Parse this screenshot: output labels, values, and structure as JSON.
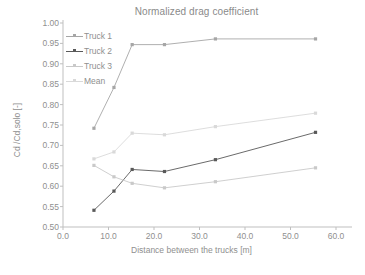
{
  "chart_data": {
    "type": "line",
    "title": "Normalized drag coefficient",
    "xlabel": "Distance between the trucks [m]",
    "ylabel": "Cd /Cd,solo [-]",
    "xlim": [
      0.0,
      60.0
    ],
    "ylim": [
      0.5,
      1.0
    ],
    "xticks": [
      "0.0",
      "10.0",
      "20.0",
      "30.0",
      "40.0",
      "50.0",
      "60.0"
    ],
    "xtick_values": [
      0.0,
      10.0,
      20.0,
      30.0,
      40.0,
      50.0,
      60.0
    ],
    "yticks": [
      "0.50",
      "0.55",
      "0.60",
      "0.65",
      "0.70",
      "0.75",
      "0.80",
      "0.85",
      "0.90",
      "0.95",
      "1.00"
    ],
    "ytick_values": [
      0.5,
      0.55,
      0.6,
      0.65,
      0.7,
      0.75,
      0.8,
      0.85,
      0.9,
      0.95,
      1.0
    ],
    "grid": false,
    "legend_position": "upper-left-inside",
    "x": [
      6.8,
      11.2,
      15.2,
      22.3,
      33.5,
      55.5
    ],
    "series": [
      {
        "name": "Truck 1",
        "color": "#a6a6a6",
        "marker": "square",
        "x": [
          6.8,
          11.2,
          15.2,
          22.3,
          33.5,
          55.5
        ],
        "values": [
          0.742,
          0.842,
          0.947,
          0.947,
          0.961,
          0.961
        ]
      },
      {
        "name": "Truck 2",
        "color": "#595959",
        "marker": "square",
        "x": [
          6.8,
          11.2,
          15.2,
          22.3,
          33.5,
          55.5
        ],
        "values": [
          0.541,
          0.588,
          0.641,
          0.636,
          0.665,
          0.732
        ]
      },
      {
        "name": "Truck 3",
        "color": "#c9c9c9",
        "marker": "square",
        "x": [
          6.8,
          11.2,
          15.2,
          22.3,
          33.5,
          55.5
        ],
        "values": [
          0.651,
          0.623,
          0.607,
          0.596,
          0.611,
          0.645
        ]
      },
      {
        "name": "Mean",
        "color": "#d9d9d9",
        "marker": "square",
        "x": [
          6.8,
          11.2,
          15.2,
          22.3,
          33.5,
          55.5
        ],
        "values": [
          0.667,
          0.684,
          0.73,
          0.726,
          0.746,
          0.779
        ]
      }
    ]
  }
}
